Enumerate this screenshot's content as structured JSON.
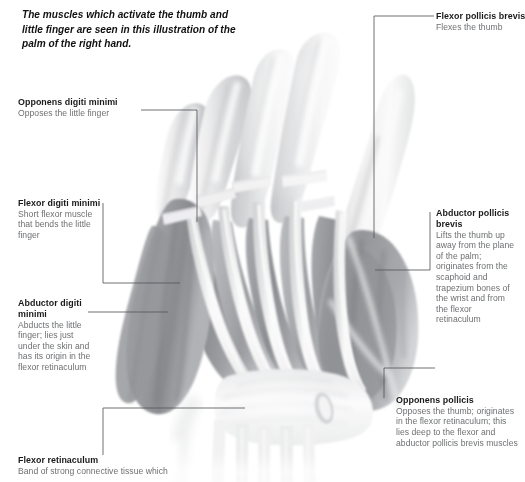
{
  "figure": {
    "intro": "The muscles which activate the thumb and little finger are seen in this illustration of the palm of the right hand."
  },
  "labels": {
    "opponens_digiti_minimi": {
      "title": "Opponens digiti minimi",
      "desc": "Opposes the little finger"
    },
    "flexor_digiti_minimi": {
      "title": "Flexor digiti minimi",
      "desc": "Short flexor muscle that bends the little finger"
    },
    "abductor_digiti_minimi": {
      "title": "Abductor digiti minimi",
      "desc": "Abducts the little finger; lies just under the skin and has its origin in the flexor retinaculum"
    },
    "flexor_retinaculum": {
      "title": "Flexor retinaculum",
      "desc": "Band of strong connective tissue which"
    },
    "flexor_pollicis_brevis": {
      "title": "Flexor pollicis brevis",
      "desc": "Flexes the thumb"
    },
    "abductor_pollicis_brevis": {
      "title": "Abductor pollicis brevis",
      "desc": "Lifts the thumb up away from the plane of the palm; originates from the scaphoid and trapezium bones of the wrist and from the flexor retinaculum"
    },
    "opponens_pollicis": {
      "title": "Opponens pollicis",
      "desc": "Opposes the thumb; originates in the flexor retinaculum; this lies deep to the flexor and abductor pollicis brevis muscles"
    }
  },
  "colors": {
    "title_text": "#1a1a1a",
    "desc_text": "#6d6f72",
    "leader_line": "#55585c",
    "background": "#ffffff",
    "muscle_dark": "#8f9094",
    "muscle_mid": "#b9babd",
    "muscle_light": "#dcdddf",
    "tendon": "#f4f4f5"
  }
}
